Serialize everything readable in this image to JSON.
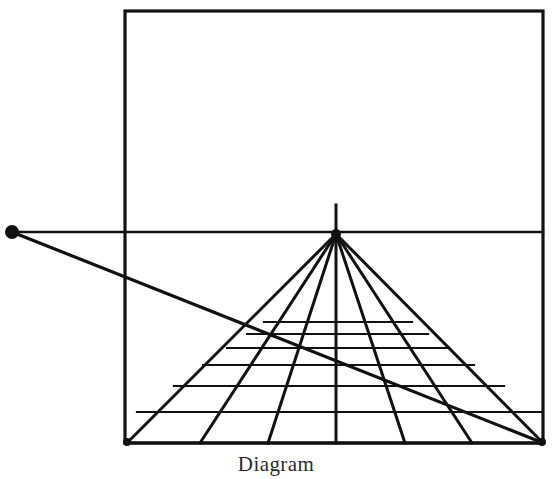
{
  "figure": {
    "caption": "Diagram",
    "caption_clipped": true,
    "background_color": "#ffffff",
    "ink_color": "#111111",
    "canvas": {
      "width": 552,
      "height": 479
    }
  },
  "labels": {
    "picture_plane": "picture plane frame",
    "horizon": "horizon line",
    "vanishing_point": "vanishing point",
    "distance_point": "distance point",
    "diagonal": "diagonal measuring line",
    "ground_line": "ground line",
    "orthogonals": "orthogonal lines",
    "transversals": "transversal lines",
    "vp_tick": "vanishing point tick"
  },
  "chart_data": {
    "type": "diagram",
    "xlim": [
      0,
      552
    ],
    "ylim": [
      0,
      479
    ],
    "grid": false,
    "legend": "none",
    "stroke_widths": {
      "frame": 3.2,
      "horizon": 2.6,
      "orthogonal": 3.0,
      "transversal": 2.2,
      "diagonal": 3.2,
      "tick": 3.0
    },
    "frame": {
      "x0": 125,
      "y0": 11,
      "x1": 543,
      "y1": 443
    },
    "horizon_line": {
      "x0": 12,
      "y0": 232,
      "x1": 543,
      "y1": 232
    },
    "vanishing_point": {
      "x": 336,
      "y": 234,
      "radius": 0
    },
    "vp_tick": {
      "x": 336,
      "y0": 205,
      "y1": 234
    },
    "distance_point": {
      "x": 12,
      "y": 232,
      "radius": 7
    },
    "diagonal": {
      "x0": 12,
      "y0": 232,
      "x1": 543,
      "y1": 443
    },
    "ground_line": {
      "x0": 125,
      "y0": 443,
      "x1": 543,
      "y1": 443
    },
    "orthogonals": {
      "from": {
        "x": 336,
        "y": 234
      },
      "base_y": 443,
      "base_x": [
        127,
        200,
        268,
        336,
        405,
        472,
        543
      ]
    },
    "transversals": {
      "y": [
        322,
        334,
        348,
        365,
        386,
        412,
        443
      ],
      "left_x": [
        264,
        247,
        227,
        203,
        174,
        137,
        127
      ],
      "right_x": [
        412,
        428,
        449,
        474,
        504,
        542,
        543
      ]
    }
  }
}
